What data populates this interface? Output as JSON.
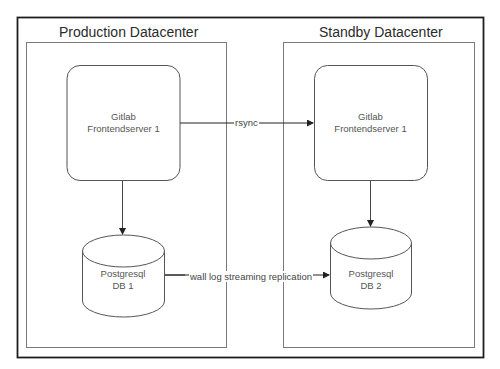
{
  "diagram": {
    "containers": [
      {
        "id": "production",
        "title": "Production Datacenter"
      },
      {
        "id": "standby",
        "title": "Standby Datacenter"
      }
    ],
    "nodes": [
      {
        "id": "gitlab_prod",
        "shape": "rounded-rect",
        "container": "production",
        "line1": "Gitlab",
        "line2": "Frontendserver 1"
      },
      {
        "id": "gitlab_standby",
        "shape": "rounded-rect",
        "container": "standby",
        "line1": "Gitlab",
        "line2": "Frontendserver 1"
      },
      {
        "id": "db1",
        "shape": "cylinder",
        "container": "production",
        "line1": "Postgresql",
        "line2": "DB 1"
      },
      {
        "id": "db2",
        "shape": "cylinder",
        "container": "standby",
        "line1": "Postgresql",
        "line2": "DB 2"
      }
    ],
    "edges": [
      {
        "from": "gitlab_prod",
        "to": "gitlab_standby",
        "label": "rsync"
      },
      {
        "from": "db1",
        "to": "db2",
        "label": "wall log streaming replication"
      },
      {
        "from": "gitlab_prod",
        "to": "db1",
        "label": ""
      },
      {
        "from": "gitlab_standby",
        "to": "db2",
        "label": ""
      }
    ],
    "colors": {
      "outer_frame": "#222222",
      "container_border": "#777777",
      "node_border": "#555555",
      "edge": "#222222",
      "text": "#333333",
      "background": "#ffffff"
    }
  }
}
